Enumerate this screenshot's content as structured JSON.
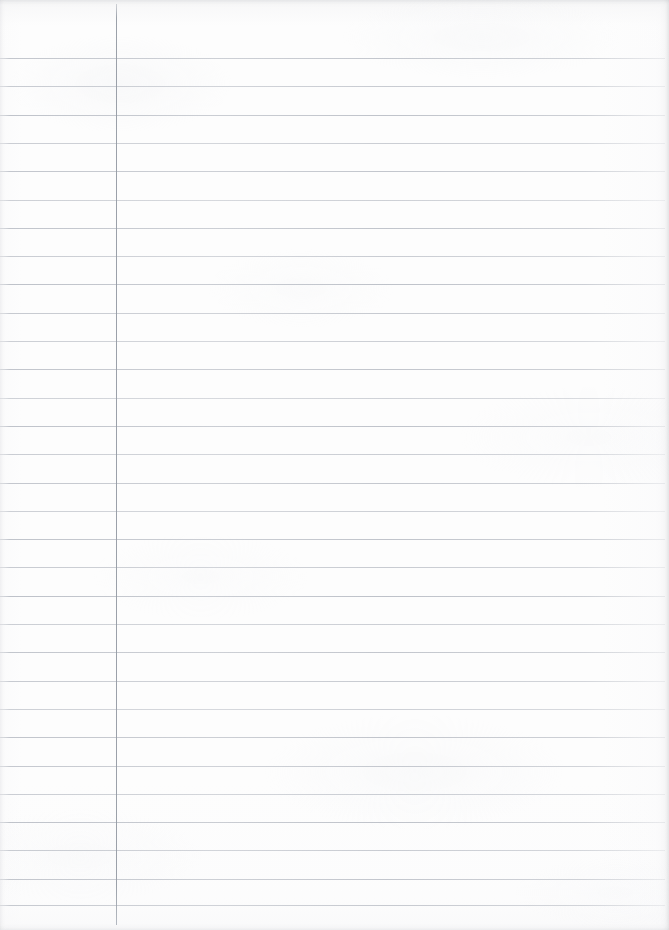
{
  "document": {
    "kind": "ruled-notebook-paper-scan",
    "title": "Blank Lined Paper",
    "width": 669,
    "height": 930,
    "paper_color": "#fdfdfd",
    "has_text_content": false,
    "visible_text": ""
  },
  "ruling": {
    "style": "wide-ruled-with-left-margin",
    "horizontal_line_color": "#b9bdc5",
    "horizontal_line_thickness": 1,
    "first_line_y": 58,
    "line_spacing": 28.3,
    "line_count": 31,
    "line_start_x": 0,
    "line_end_x": 665,
    "margin_line_color": "#9ba1a9",
    "margin_line_x": 115.5,
    "margin_line_thickness": 1,
    "margin_line_top_y": 4,
    "margin_line_bottom_y": 925,
    "line_y_positions": [
      58,
      86.3,
      114.6,
      142.9,
      171.2,
      199.5,
      227.8,
      256.1,
      284.4,
      312.7,
      341.0,
      369.3,
      397.6,
      425.9,
      454.2,
      482.5,
      510.8,
      539.1,
      567.4,
      595.7,
      624.0,
      652.3,
      680.6,
      708.9,
      737.2,
      765.5,
      793.8,
      822.1,
      850.4,
      878.7,
      905.0
    ],
    "line_opacities": [
      0.85,
      0.78,
      0.9,
      0.74,
      0.86,
      0.7,
      0.88,
      0.76,
      0.92,
      0.8,
      0.72,
      0.87,
      0.68,
      0.9,
      0.75,
      0.84,
      0.71,
      0.89,
      0.78,
      0.93,
      0.73,
      0.86,
      0.79,
      0.7,
      0.88,
      0.82,
      0.74,
      0.91,
      0.77,
      0.85,
      0.8
    ]
  }
}
